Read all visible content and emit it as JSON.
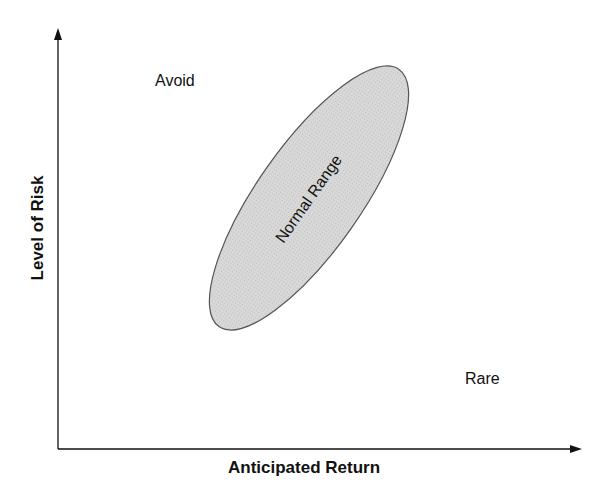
{
  "diagram": {
    "x_axis_label": "Anticipated Return",
    "y_axis_label": "Level of Risk",
    "regions": {
      "top_left": "Avoid",
      "center": "Normal Range",
      "bottom_right": "Rare"
    },
    "colors": {
      "ellipse_fill": "#d4d4d4",
      "ellipse_stroke": "#555555",
      "axis": "#111111"
    }
  }
}
